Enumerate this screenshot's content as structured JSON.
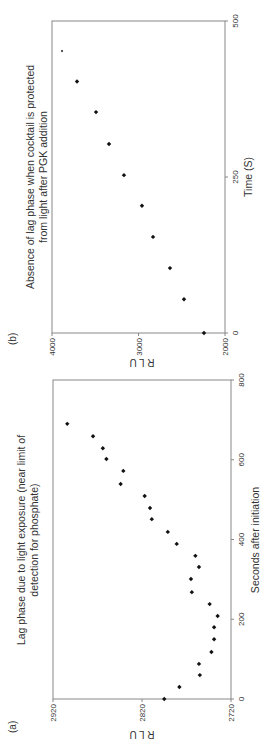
{
  "figure": {
    "panels": [
      {
        "id": "a",
        "label": "(a)"
      },
      {
        "id": "b",
        "label": "(b)"
      }
    ]
  },
  "chart_data": [
    {
      "type": "scatter",
      "panel_label": "(a)",
      "title": "Lag phase due to light exposure (near limit of detection for phosphate)",
      "title_lines": [
        "Lag phase due to light exposure (near limit of",
        "detection for phosphate)"
      ],
      "xlabel": "Seconds after initiation",
      "ylabel": "R L U",
      "xlim": [
        0,
        800
      ],
      "ylim": [
        2720,
        2920
      ],
      "xticks": [
        0,
        200,
        400,
        600,
        800
      ],
      "yticks": [
        2720,
        2820,
        2920
      ],
      "ytick_labels": [
        "2720",
        "2820",
        "2920"
      ],
      "grid": false,
      "legend": null,
      "x": [
        0,
        30,
        60,
        88,
        118,
        150,
        180,
        208,
        238,
        268,
        301,
        331,
        359,
        389,
        419,
        451,
        479,
        509,
        539,
        572,
        602,
        629,
        659,
        690
      ],
      "y": [
        2795,
        2778,
        2755,
        2756,
        2742,
        2739,
        2739,
        2735,
        2744,
        2764,
        2765,
        2756,
        2760,
        2781,
        2791,
        2809,
        2811,
        2817,
        2844,
        2841,
        2860,
        2864,
        2875,
        2904
      ]
    },
    {
      "type": "scatter",
      "panel_label": "(b)",
      "title": "Absence of lag phase when cocktail is protected from light after PGK addition",
      "title_lines": [
        "Absence of lag phase when cocktail is protected",
        "from light after PGK addition"
      ],
      "xlabel": "Time (S)",
      "ylabel": "R L U",
      "xlim": [
        0,
        500
      ],
      "ylim": [
        2000,
        4000
      ],
      "xticks": [
        0,
        250,
        500
      ],
      "yticks": [
        2000,
        3000,
        4000
      ],
      "ytick_labels": [
        "2000",
        "3000",
        "4000"
      ],
      "grid": false,
      "legend": null,
      "x": [
        0,
        54,
        104,
        154,
        204,
        253,
        303,
        354,
        403,
        452
      ],
      "y": [
        2243,
        2474,
        2636,
        2832,
        2960,
        3168,
        3341,
        3491,
        3711,
        3884
      ]
    }
  ],
  "colors": {
    "axis": "#888888",
    "marker": "#111111",
    "text": "#333333"
  }
}
